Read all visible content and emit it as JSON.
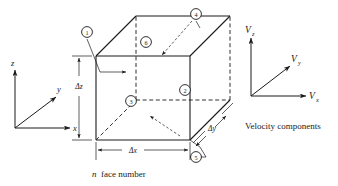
{
  "figure": {
    "background_color": "#ffffff",
    "ink_color": "#1a1a1a"
  },
  "coordinate_axes": {
    "name": "position-axes",
    "origin": [
      15,
      128
    ],
    "labels": {
      "z": "z",
      "y": "y",
      "x": "x"
    }
  },
  "control_volume": {
    "name": "cube",
    "face_numbers": [
      {
        "id": "face-1",
        "label": "1",
        "cx": 87,
        "cy": 32,
        "describes": "front-left face"
      },
      {
        "id": "face-6",
        "label": "6",
        "cx": 146,
        "cy": 42,
        "describes": "top face"
      },
      {
        "id": "face-4",
        "label": "4",
        "cx": 196,
        "cy": 14,
        "describes": "back-right face"
      },
      {
        "id": "face-2",
        "label": "2",
        "cx": 185,
        "cy": 90,
        "describes": "front-right face"
      },
      {
        "id": "face-3",
        "label": "3",
        "cx": 131,
        "cy": 101,
        "describes": "back-left face"
      },
      {
        "id": "face-5",
        "label": "5",
        "cx": 196,
        "cy": 157,
        "describes": "bottom face"
      }
    ],
    "dimensions": {
      "delta_z": "Δz",
      "delta_x": "Δx",
      "delta_y": "Δy"
    },
    "caption_italic": "n",
    "caption_rest": "face number"
  },
  "velocity_components": {
    "name": "velocity-axes",
    "origin": [
      251,
      96
    ],
    "labels": {
      "vz_symbol": "V",
      "vz_subscript": "z",
      "vy_symbol": "V",
      "vy_subscript": "y",
      "vx_symbol": "V",
      "vx_subscript": "x"
    },
    "caption": "Velocity components"
  }
}
